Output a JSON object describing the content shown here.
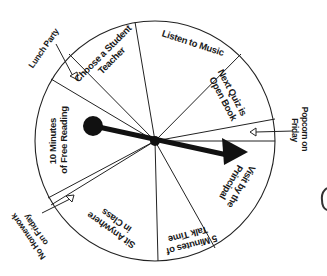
{
  "wheel": {
    "segments": [
      {
        "id": "choose-student-teacher",
        "line1": "Choose a Student",
        "line2": "Teacher"
      },
      {
        "id": "listen-to-music",
        "line1": "Listen to Music",
        "line2": ""
      },
      {
        "id": "next-quiz-open-book",
        "line1": "Next Quiz is",
        "line2": "Open Book"
      },
      {
        "id": "visit-by-principal",
        "line1": "Visit by the",
        "line2": "Principal"
      },
      {
        "id": "five-minutes-talk-time",
        "line1": "5 Minutes of",
        "line2": "Talk Time"
      },
      {
        "id": "sit-anywhere",
        "line1": "Sit Anywhere",
        "line2": "in Class"
      },
      {
        "id": "ten-minutes-free-reading",
        "line1": "10 Minutes",
        "line2": "of Free Reading"
      }
    ],
    "outer_labels": [
      {
        "id": "lunch-party",
        "line1": "Lunch Party",
        "line2": ""
      },
      {
        "id": "popcorn-friday",
        "line1": "Popcorn on",
        "line2": "Friday"
      },
      {
        "id": "no-homework-friday",
        "line1": "No Homework",
        "line2": "on Friday"
      }
    ],
    "colors": {
      "line": "#222222",
      "fill": "#ffffff",
      "pointer": "#111111"
    }
  }
}
